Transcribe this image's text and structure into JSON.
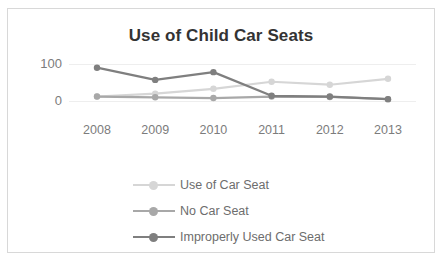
{
  "chart_data": {
    "type": "line",
    "title": "Use of Child Car Seats",
    "xlabel": "",
    "ylabel": "",
    "categories": [
      "2008",
      "2009",
      "2010",
      "2011",
      "2012",
      "2013"
    ],
    "yticks": [
      0,
      100
    ],
    "ylim": [
      0,
      110
    ],
    "grid": true,
    "legend_position": "bottom",
    "series": [
      {
        "name": "Use of Car Seat",
        "color": "#d6d6d6",
        "values": [
          12,
          20,
          33,
          52,
          44,
          60
        ]
      },
      {
        "name": "No Car Seat",
        "color": "#a8a8a8",
        "values": [
          12,
          10,
          8,
          12,
          11,
          5
        ]
      },
      {
        "name": "Improperly Used Car Seat",
        "color": "#7f7f7f",
        "values": [
          90,
          57,
          78,
          14,
          12,
          5
        ]
      }
    ]
  },
  "frame": {
    "border_color": "#d8d8d8",
    "background": "#ffffff"
  },
  "axis": {
    "tick_color": "#7c7c7c",
    "gridline_color": "#eeeeee"
  }
}
